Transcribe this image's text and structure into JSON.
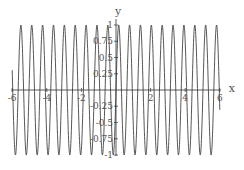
{
  "chart_data": {
    "type": "line",
    "title": "",
    "function": "sin(10 x)",
    "xlabel": "x",
    "ylabel": "y",
    "xlim": [
      -6,
      6
    ],
    "ylim": [
      -1,
      1
    ],
    "x_ticks": [
      -6,
      -4,
      -2,
      2,
      4,
      6
    ],
    "x_tick_labels": [
      "-6",
      "-4",
      "-2",
      "2",
      "4",
      "6"
    ],
    "y_ticks": [
      -1,
      -0.75,
      -0.5,
      -0.25,
      0.25,
      0.5,
      0.75,
      1
    ],
    "y_tick_labels": [
      "-1",
      "-0.75",
      "-0.5",
      "-0.25",
      "0.25",
      "0.5",
      "0.75",
      "1"
    ],
    "grid": false,
    "legend": null,
    "series": [
      {
        "name": "sin(10x)",
        "color": "#444444",
        "frequency": 10,
        "amplitude": 1,
        "samples": 1200
      }
    ]
  },
  "layout": {
    "origin_px": [
      116,
      90
    ],
    "px_per_x": 17.3,
    "px_per_y": 65
  }
}
